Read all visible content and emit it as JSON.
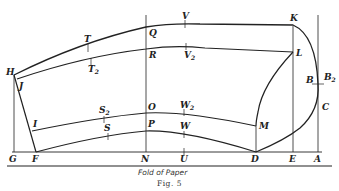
{
  "figure": {
    "caption": "Fold of Paper",
    "number": "Fig. 5"
  },
  "points": {
    "H": "H",
    "J": "J",
    "T": "T",
    "T2": "T",
    "T2_sub": "2",
    "Q": "Q",
    "R": "R",
    "V": "V",
    "V2": "V",
    "V2_sub": "2",
    "K": "K",
    "L": "L",
    "B": "B",
    "B2": "B",
    "B2_sub": "2",
    "C": "C",
    "M": "M",
    "I": "I",
    "S2": "S",
    "S2_sub": "2",
    "S": "S",
    "O": "O",
    "P": "P",
    "W2": "W",
    "W2_sub": "2",
    "W": "W",
    "G": "G",
    "F": "F",
    "N": "N",
    "U": "U",
    "D": "D",
    "E": "E",
    "A": "A"
  },
  "colors": {
    "ink": "#222222",
    "paper": "#ffffff"
  }
}
